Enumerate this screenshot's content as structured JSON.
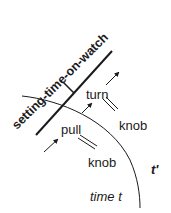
{
  "diagram": {
    "event_label": "setting-time-on-watch",
    "actions": [
      {
        "verb": "turn",
        "object": "knob"
      },
      {
        "verb": "pull",
        "object": "knob"
      }
    ],
    "labels": {
      "turn": "turn",
      "pull": "pull",
      "knob_upper": "knob",
      "knob_lower": "knob",
      "t_prime": "t'",
      "time_t": "time t"
    },
    "colors": {
      "ink": "#1a1a1a",
      "background": "#ffffff"
    }
  }
}
